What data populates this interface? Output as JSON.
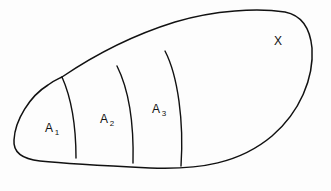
{
  "figure": {
    "name": "set-partition-diagram",
    "background_color": "#fdfdfd",
    "ink_color": "#111111"
  },
  "universal_set": {
    "label": "X",
    "label_position": {
      "x": 274,
      "y": 34
    }
  },
  "subsets": [
    {
      "id": "A1",
      "base": "A",
      "subscript": "1",
      "label_position": {
        "x": 45,
        "y": 121
      }
    },
    {
      "id": "A2",
      "base": "A",
      "subscript": "2",
      "label_position": {
        "x": 100,
        "y": 112
      }
    },
    {
      "id": "A3",
      "base": "A",
      "subscript": "3",
      "label_position": {
        "x": 152,
        "y": 102
      }
    }
  ],
  "geometry": {
    "outer_boundary": "M 62 77 C 90 58 130 36 175 22 C 215 10 258 8 285 12 C 300 15 310 27 312 48 C 314 78 300 112 272 136 C 240 163 200 170 150 168 C 110 166 70 164 40 161 C 22 159 13 152 14 140 C 15 120 30 96 48 85 C 53 81 58 79 62 77 Z",
    "divider_1": "M 62 77 C 70 95 76 120 76 158",
    "divider_2": "M 117 66 C 128 88 134 122 133 163",
    "divider_3": "M 165 51 C 178 76 184 122 181 166"
  }
}
